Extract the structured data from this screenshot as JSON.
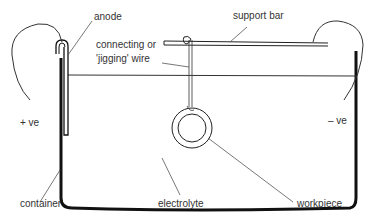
{
  "labels": {
    "anode": "anode",
    "support_bar": "support bar",
    "connecting_line1": "connecting or",
    "connecting_line2": "'jigging' wire",
    "positive": "+ ve",
    "negative": "– ve",
    "container": "container",
    "electrolyte": "electrolyte",
    "workpiece": "workpiece"
  },
  "colors": {
    "ink": "#111111",
    "leader": "#555555",
    "text": "#333333",
    "background": "#ffffff"
  }
}
